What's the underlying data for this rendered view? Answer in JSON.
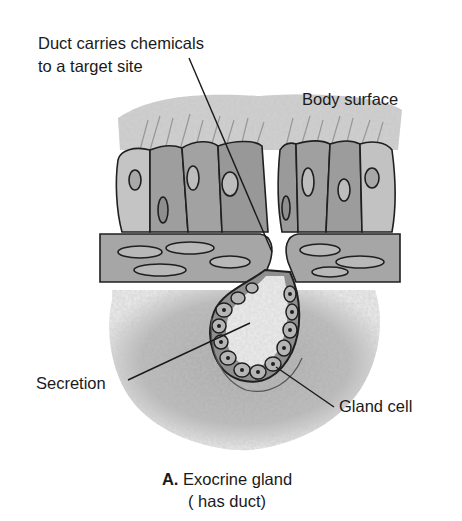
{
  "figure": {
    "title_letter": "A.",
    "title": "Exocrine gland",
    "subtitle": "( has duct)"
  },
  "labels": {
    "duct_line1": "Duct carries chemicals",
    "duct_line2": "to a target site",
    "body_surface": "Body surface",
    "secretion": "Secretion",
    "gland_cell": "Gland cell"
  },
  "colors": {
    "background": "#ffffff",
    "tissue_gray": "#a8a8a8",
    "cell_fill": "#9a9a9a",
    "outline": "#1f1f1f",
    "secretion_fill": "#e6e6e6",
    "text": "#1a1a1a"
  }
}
